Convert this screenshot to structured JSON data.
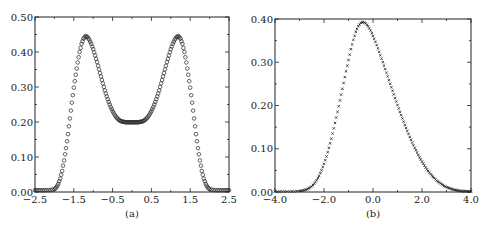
{
  "chart_data": [
    {
      "id": "a",
      "type": "scatter",
      "caption": "(a)",
      "title": "",
      "xlabel": "",
      "ylabel": "",
      "xlim": [
        -2.5,
        2.5
      ],
      "ylim": [
        0.0,
        0.5
      ],
      "xticks": [
        "-2.5",
        "-1.5",
        "-0.5",
        "0.5",
        "1.5",
        "2.5"
      ],
      "xtick_values": [
        -2.5,
        -1.5,
        -0.5,
        0.5,
        1.5,
        2.5
      ],
      "yticks": [
        "0.00",
        "0.10",
        "0.20",
        "0.30",
        "0.40",
        "0.50"
      ],
      "ytick_values": [
        0.0,
        0.1,
        0.2,
        0.3,
        0.4,
        0.5
      ],
      "marker": "circle",
      "grid": false,
      "series": [
        {
          "name": "density",
          "description": "symmetric bimodal density, peaks ~0.44 at x≈±1.2, local min ~0.195 at x=0, ~0 for |x|>2.0",
          "x": [
            -2.5,
            -2.4,
            -2.3,
            -2.2,
            -2.1,
            -2.0,
            -1.95,
            -1.9,
            -1.85,
            -1.8,
            -1.75,
            -1.7,
            -1.65,
            -1.6,
            -1.55,
            -1.5,
            -1.45,
            -1.4,
            -1.35,
            -1.3,
            -1.25,
            -1.2,
            -1.15,
            -1.1,
            -1.05,
            -1.0,
            -0.95,
            -0.9,
            -0.85,
            -0.8,
            -0.75,
            -0.7,
            -0.65,
            -0.6,
            -0.55,
            -0.5,
            -0.45,
            -0.4,
            -0.35,
            -0.3,
            -0.25,
            -0.2,
            -0.15,
            -0.1,
            -0.05,
            0.0,
            0.05,
            0.1,
            0.15,
            0.2,
            0.25,
            0.3,
            0.35,
            0.4,
            0.45,
            0.5,
            0.55,
            0.6,
            0.65,
            0.7,
            0.75,
            0.8,
            0.85,
            0.9,
            0.95,
            1.0,
            1.05,
            1.1,
            1.15,
            1.2,
            1.25,
            1.3,
            1.35,
            1.4,
            1.45,
            1.5,
            1.55,
            1.6,
            1.65,
            1.7,
            1.75,
            1.8,
            1.85,
            1.9,
            1.95,
            2.0,
            2.1,
            2.2,
            2.3,
            2.4,
            2.5
          ],
          "y": [
            0.0,
            0.0,
            0.0,
            0.0,
            0.0005,
            0.003,
            0.008,
            0.018,
            0.033,
            0.055,
            0.085,
            0.12,
            0.16,
            0.205,
            0.25,
            0.293,
            0.33,
            0.365,
            0.395,
            0.418,
            0.433,
            0.44,
            0.438,
            0.43,
            0.418,
            0.403,
            0.385,
            0.366,
            0.345,
            0.325,
            0.305,
            0.285,
            0.268,
            0.252,
            0.238,
            0.226,
            0.216,
            0.208,
            0.202,
            0.198,
            0.196,
            0.195,
            0.194,
            0.194,
            0.194,
            0.194,
            0.194,
            0.194,
            0.194,
            0.195,
            0.196,
            0.198,
            0.202,
            0.208,
            0.216,
            0.226,
            0.238,
            0.252,
            0.268,
            0.285,
            0.305,
            0.325,
            0.345,
            0.366,
            0.385,
            0.403,
            0.418,
            0.43,
            0.438,
            0.44,
            0.433,
            0.418,
            0.395,
            0.365,
            0.33,
            0.293,
            0.25,
            0.205,
            0.16,
            0.12,
            0.085,
            0.055,
            0.033,
            0.018,
            0.008,
            0.003,
            0.0005,
            0.0,
            0.0,
            0.0,
            0.0
          ]
        }
      ]
    },
    {
      "id": "b",
      "type": "scatter",
      "caption": "(b)",
      "title": "",
      "xlabel": "",
      "ylabel": "",
      "xlim": [
        -4.0,
        4.0
      ],
      "ylim": [
        0.0,
        0.4
      ],
      "xticks": [
        "-4.0",
        "-2.0",
        "0.0",
        "2.0",
        "4.0"
      ],
      "xtick_values": [
        -4.0,
        -2.0,
        0.0,
        2.0,
        4.0
      ],
      "yticks": [
        "0.00",
        "0.10",
        "0.20",
        "0.30",
        "0.40"
      ],
      "ytick_values": [
        0.0,
        0.1,
        0.2,
        0.3,
        0.4
      ],
      "marker": "x",
      "grid": false,
      "series": [
        {
          "name": "density",
          "description": "right-skewed unimodal density, peak ~0.39 at x≈-0.4, ~0 below -3 and above 3.8",
          "x": [
            -4.0,
            -3.8,
            -3.6,
            -3.4,
            -3.2,
            -3.0,
            -2.9,
            -2.8,
            -2.7,
            -2.6,
            -2.5,
            -2.4,
            -2.3,
            -2.2,
            -2.1,
            -2.0,
            -1.9,
            -1.8,
            -1.7,
            -1.6,
            -1.5,
            -1.4,
            -1.3,
            -1.2,
            -1.1,
            -1.0,
            -0.9,
            -0.8,
            -0.7,
            -0.6,
            -0.5,
            -0.4,
            -0.3,
            -0.2,
            -0.1,
            0.0,
            0.1,
            0.2,
            0.3,
            0.4,
            0.5,
            0.6,
            0.7,
            0.8,
            0.9,
            1.0,
            1.1,
            1.2,
            1.3,
            1.4,
            1.5,
            1.6,
            1.7,
            1.8,
            1.9,
            2.0,
            2.1,
            2.2,
            2.3,
            2.4,
            2.5,
            2.6,
            2.7,
            2.8,
            2.9,
            3.0,
            3.1,
            3.2,
            3.3,
            3.4,
            3.5,
            3.6,
            3.7,
            3.8,
            3.9,
            4.0
          ],
          "y": [
            0.0,
            0.0,
            0.0,
            0.0,
            0.0005,
            0.001,
            0.002,
            0.003,
            0.005,
            0.008,
            0.012,
            0.018,
            0.026,
            0.036,
            0.049,
            0.064,
            0.081,
            0.101,
            0.122,
            0.146,
            0.171,
            0.197,
            0.224,
            0.251,
            0.278,
            0.304,
            0.329,
            0.351,
            0.369,
            0.382,
            0.39,
            0.392,
            0.389,
            0.382,
            0.372,
            0.36,
            0.346,
            0.331,
            0.315,
            0.299,
            0.283,
            0.266,
            0.249,
            0.233,
            0.216,
            0.2,
            0.184,
            0.169,
            0.154,
            0.14,
            0.126,
            0.113,
            0.101,
            0.09,
            0.079,
            0.069,
            0.06,
            0.051,
            0.044,
            0.037,
            0.031,
            0.025,
            0.021,
            0.017,
            0.013,
            0.01,
            0.008,
            0.006,
            0.004,
            0.003,
            0.002,
            0.001,
            0.0008,
            0.0005,
            0.0002,
            0.0
          ]
        }
      ]
    }
  ],
  "layout": {
    "panels": [
      {
        "left": 35,
        "right": 229,
        "top": 17,
        "bottom": 192
      },
      {
        "left": 275,
        "right": 471,
        "top": 19,
        "bottom": 192
      }
    ]
  }
}
